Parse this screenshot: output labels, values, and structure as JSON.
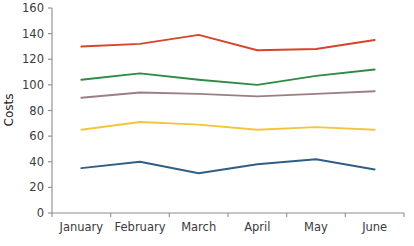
{
  "chart_data": {
    "type": "line",
    "title": "",
    "xlabel": "",
    "ylabel": "Costs",
    "categories": [
      "January",
      "February",
      "March",
      "April",
      "May",
      "June"
    ],
    "ylim": [
      0,
      160
    ],
    "yticks": [
      0,
      20,
      40,
      60,
      80,
      100,
      120,
      140,
      160
    ],
    "ytick_labels": [
      "0",
      "20",
      "40",
      "60",
      "80",
      "100",
      "120",
      "140",
      "160"
    ],
    "grid": false,
    "legend": "none",
    "series": [
      {
        "name": "series-red",
        "color": "#d8442a",
        "values": [
          130,
          132,
          139,
          127,
          128,
          135
        ]
      },
      {
        "name": "series-green",
        "color": "#2e8b45",
        "values": [
          104,
          109,
          104,
          100,
          107,
          112
        ]
      },
      {
        "name": "series-mauve",
        "color": "#9b7f85",
        "values": [
          90,
          94,
          93,
          91,
          93,
          95
        ]
      },
      {
        "name": "series-yellow",
        "color": "#f2c53d",
        "values": [
          65,
          71,
          69,
          65,
          67,
          65
        ]
      },
      {
        "name": "series-blue",
        "color": "#2f5f83",
        "values": [
          35,
          40,
          31,
          38,
          42,
          34
        ]
      }
    ]
  },
  "axis": {
    "y_title": "Costs"
  }
}
